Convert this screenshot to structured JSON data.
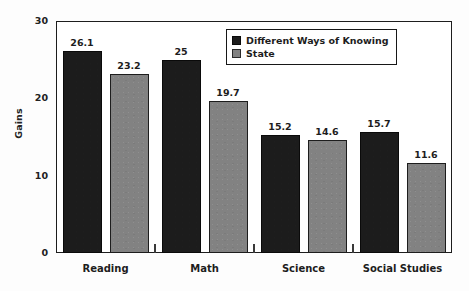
{
  "chart_data": {
    "type": "bar",
    "title": "",
    "xlabel": "",
    "ylabel": "Gains",
    "categories": [
      "Reading",
      "Math",
      "Science",
      "Social Studies"
    ],
    "series": [
      {
        "name": "Different Ways of Knowing",
        "color": "#1c1c1c",
        "values": [
          26.1,
          25,
          15.2,
          15.7
        ],
        "labels": [
          "26.1",
          "25",
          "15.2",
          "15.7"
        ]
      },
      {
        "name": "State",
        "color": "#828282",
        "values": [
          23.2,
          19.7,
          14.6,
          11.6
        ],
        "labels": [
          "23.2",
          "19.7",
          "14.6",
          "11.6"
        ]
      }
    ],
    "ylim": [
      0,
      30
    ],
    "yticks": [
      0,
      10,
      20,
      30
    ],
    "ytick_labels": [
      "0",
      "10",
      "20",
      "30"
    ],
    "grid": false,
    "legend_position": "upper right",
    "value_labels_shown": true
  },
  "legend": {
    "entries": [
      {
        "label": "Different Ways of Knowing",
        "swatch": "legend-swatch-black"
      },
      {
        "label": "State",
        "swatch": "legend-swatch-gray"
      }
    ]
  },
  "axes": {
    "y_title": "Gains"
  }
}
